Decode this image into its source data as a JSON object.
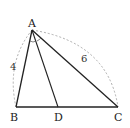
{
  "diagram": {
    "type": "triangle-angle-bisector",
    "points": {
      "A": {
        "label": "A",
        "x": 32,
        "y": 30
      },
      "B": {
        "label": "B",
        "x": 16,
        "y": 107
      },
      "D": {
        "label": "D",
        "x": 58,
        "y": 107
      },
      "C": {
        "label": "C",
        "x": 118,
        "y": 107
      }
    },
    "segments": [
      "AB",
      "AC",
      "BC",
      "AD"
    ],
    "lengths": {
      "AB": "4",
      "AC": "6"
    },
    "angle_marks": "equal angles BAD and DAC at vertex A",
    "colors": {
      "line": "#222222",
      "dashed_arc": "#999999"
    }
  }
}
